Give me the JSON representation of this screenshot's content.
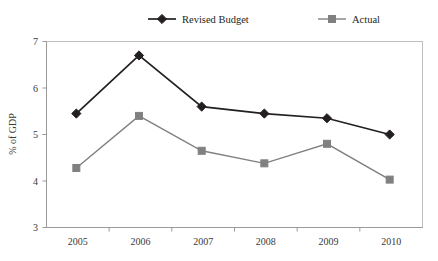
{
  "chart_data": {
    "type": "line",
    "title": "",
    "subtitle": "",
    "xlabel": "",
    "ylabel": "% of GDP",
    "categories": [
      "2005",
      "2006",
      "2007",
      "2008",
      "2009",
      "2010"
    ],
    "series": [
      {
        "name": "Revised Budget",
        "marker": "diamond",
        "color": "#231f20",
        "values": [
          5.45,
          6.7,
          5.6,
          5.45,
          5.35,
          5.0
        ]
      },
      {
        "name": "Actual",
        "marker": "square",
        "color": "#808080",
        "values": [
          4.28,
          5.4,
          4.65,
          4.38,
          4.8,
          4.03
        ]
      }
    ],
    "ylim": [
      3,
      7
    ],
    "yticks": [
      3,
      4,
      5,
      6,
      7
    ],
    "ytick_labels": [
      "3",
      "4",
      "5",
      "6",
      "7"
    ],
    "xlim_categories": 6,
    "grid": false,
    "legend_position": "top-center",
    "frame": true
  },
  "legend": {
    "items": [
      {
        "label": "Revised Budget",
        "marker_name": "diamond-marker-black",
        "color": "#231f20"
      },
      {
        "label": "Actual",
        "marker_name": "square-marker-gray",
        "color": "#808080"
      }
    ]
  },
  "axes": {
    "y_title": "% of GDP",
    "y_tick_labels": [
      "7",
      "6",
      "5",
      "4",
      "3"
    ],
    "x_tick_labels": [
      "2005",
      "2006",
      "2007",
      "2008",
      "2009",
      "2010"
    ]
  },
  "colors": {
    "revised_budget": "#231f20",
    "actual": "#808080",
    "frame": "#bfbfbf",
    "axis": "#9a9a9a",
    "background": "#ffffff",
    "text": "#231f20"
  }
}
